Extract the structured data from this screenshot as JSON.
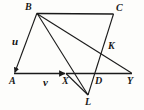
{
  "figure": {
    "background_color": "#fdfdfb",
    "stroke_color": "#1a1a1a",
    "label_color": "#1a1a1a"
  },
  "points": {
    "B": {
      "label": "B",
      "x": 37,
      "y": 13,
      "label_x": 25,
      "label_y": 2
    },
    "C": {
      "label": "C",
      "x": 113,
      "y": 14,
      "label_x": 116,
      "label_y": 3
    },
    "A": {
      "label": "A",
      "x": 14,
      "y": 74,
      "label_x": 9,
      "label_y": 76
    },
    "X": {
      "label": "X",
      "x": 66,
      "y": 73,
      "label_x": 62,
      "label_y": 76
    },
    "D": {
      "label": "D",
      "x": 95,
      "y": 73,
      "label_x": 95,
      "label_y": 76
    },
    "Y": {
      "label": "Y",
      "x": 131,
      "y": 73,
      "label_x": 127,
      "label_y": 76
    },
    "K": {
      "label": "K",
      "x": 106,
      "y": 50,
      "label_x": 108,
      "label_y": 41
    },
    "L": {
      "label": "L",
      "x": 88,
      "y": 95,
      "label_x": 85,
      "label_y": 97
    }
  },
  "vectors": {
    "u": {
      "label": "u",
      "from": "B",
      "to": "A",
      "label_x": 12,
      "label_y": 36
    },
    "v": {
      "label": "v",
      "from": "A",
      "to": "X",
      "label_x": 43,
      "label_y": 77
    }
  },
  "segments": [
    {
      "name": "B-A",
      "from": "B",
      "to": "A",
      "arrow": true
    },
    {
      "name": "A-Y",
      "from": "A",
      "to": "Y",
      "arrow": true
    },
    {
      "name": "B-C",
      "from": "B",
      "to": "C",
      "arrow": false
    },
    {
      "name": "B-L",
      "from": "B",
      "to": "L",
      "arrow": false
    },
    {
      "name": "B-Y",
      "from": "B",
      "to": "Y",
      "arrow": false
    },
    {
      "name": "C-L",
      "from": "C",
      "to": "L",
      "arrow": false
    },
    {
      "name": "X-L",
      "from": "X",
      "to": "L",
      "arrow": false
    }
  ]
}
